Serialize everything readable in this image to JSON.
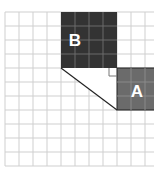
{
  "diagram": {
    "grid": {
      "origin_x": 5,
      "origin_y": 12,
      "cell": 14,
      "cols": 11,
      "rows": 11,
      "line_color": "#cfcfcf"
    },
    "squares": [
      {
        "label": "B",
        "col": 4,
        "row": 0,
        "w": 4,
        "h": 4,
        "fill": "#333333"
      },
      {
        "label": "A",
        "col": 8,
        "row": 4,
        "w": 4,
        "h": 3,
        "fill": "#6b6b6b"
      }
    ],
    "right_angle_marker": {
      "x": 108,
      "y": 68,
      "size": 8
    },
    "triangle": {
      "points": "61,68 117,68 117,110"
    }
  }
}
